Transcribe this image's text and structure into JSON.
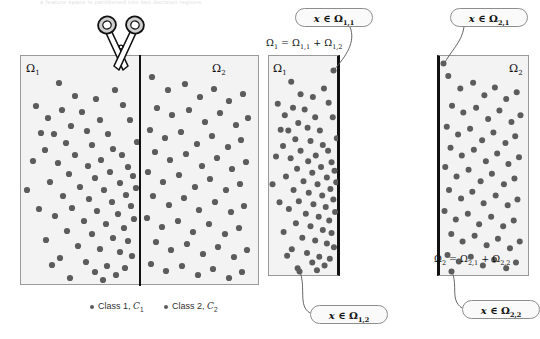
{
  "figure": {
    "top_caption": "a feature space is partitioned into two decision regions",
    "background_color": "#ffffff",
    "panel_fill": "#f3f3f3",
    "panel_border_color": "#9a9a9a",
    "cut_line_color": "#111111",
    "dot_color": "#5c5c5c"
  },
  "panels": {
    "left": {
      "name": "full-feature-space",
      "omega_left_label": "Ω",
      "omega_left_sub": "1",
      "omega_right_label": "Ω",
      "omega_right_sub": "2"
    },
    "middle": {
      "name": "omega-1-region",
      "omega_label": "Ω",
      "omega_sub": "1",
      "equation_main": "Ω",
      "equation_sub1": "1",
      "equation_rest": " = Ω",
      "equation_sub2": "1,1",
      "equation_plus": " + Ω",
      "equation_sub3": "1,2"
    },
    "right": {
      "name": "omega-2-region",
      "omega_label": "Ω",
      "omega_sub": "2",
      "equation_main": "Ω",
      "equation_sub1": "2",
      "equation_rest": " = Ω",
      "equation_sub2": "2,1",
      "equation_plus": " + Ω",
      "equation_sub3": "2,2"
    }
  },
  "callouts": {
    "omega_1_1": {
      "x": "x",
      "member": " ∈ Ω",
      "sub": "1,1"
    },
    "omega_1_2": {
      "x": "x",
      "member": " ∈ Ω",
      "sub": "1,2"
    },
    "omega_2_1": {
      "x": "x",
      "member": " ∈ Ω",
      "sub": "2,1"
    },
    "omega_2_2": {
      "x": "x",
      "member": " ∈ Ω",
      "sub": "2,2"
    }
  },
  "legend": {
    "items": [
      {
        "label": "Class 1, ",
        "symbol": "C",
        "sub": "1"
      },
      {
        "label": "Class 2, ",
        "symbol": "C",
        "sub": "2"
      }
    ]
  },
  "icons": {
    "scissors": "scissors-icon"
  },
  "chart_data": {
    "type": "scatter",
    "title": "",
    "xlabel": "",
    "ylabel": "",
    "grid": false,
    "legend_position": "bottom",
    "series": [
      {
        "name": "Class 1, C1",
        "color": "#5c5c5c"
      },
      {
        "name": "Class 2, C2",
        "color": "#5c5c5c"
      }
    ],
    "note": "Two overlapping Gaussian-like clouds of gray points; a vertical cut at x=139px separates region Omega-1 (left) from Omega-2 (right).",
    "points_left_region": [
      [
        59,
        83
      ],
      [
        75,
        96
      ],
      [
        36,
        106
      ],
      [
        62,
        110
      ],
      [
        48,
        118
      ],
      [
        82,
        112
      ],
      [
        96,
        99
      ],
      [
        71,
        126
      ],
      [
        87,
        131
      ],
      [
        54,
        134
      ],
      [
        100,
        120
      ],
      [
        66,
        143
      ],
      [
        92,
        145
      ],
      [
        108,
        134
      ],
      [
        45,
        150
      ],
      [
        75,
        155
      ],
      [
        113,
        149
      ],
      [
        58,
        163
      ],
      [
        88,
        166
      ],
      [
        101,
        160
      ],
      [
        122,
        155
      ],
      [
        69,
        174
      ],
      [
        95,
        178
      ],
      [
        110,
        172
      ],
      [
        128,
        167
      ],
      [
        50,
        182
      ],
      [
        80,
        187
      ],
      [
        104,
        190
      ],
      [
        120,
        183
      ],
      [
        133,
        176
      ],
      [
        63,
        196
      ],
      [
        89,
        199
      ],
      [
        112,
        202
      ],
      [
        126,
        195
      ],
      [
        136,
        188
      ],
      [
        72,
        208
      ],
      [
        97,
        211
      ],
      [
        118,
        214
      ],
      [
        131,
        206
      ],
      [
        55,
        216
      ],
      [
        84,
        221
      ],
      [
        106,
        224
      ],
      [
        124,
        228
      ],
      [
        134,
        219
      ],
      [
        67,
        231
      ],
      [
        92,
        234
      ],
      [
        113,
        238
      ],
      [
        128,
        241
      ],
      [
        78,
        246
      ],
      [
        100,
        249
      ],
      [
        120,
        252
      ],
      [
        132,
        256
      ],
      [
        60,
        258
      ],
      [
        86,
        262
      ],
      [
        107,
        266
      ],
      [
        125,
        268
      ],
      [
        95,
        272
      ],
      [
        116,
        275
      ],
      [
        70,
        278
      ],
      [
        103,
        280
      ],
      [
        41,
        133
      ],
      [
        33,
        161
      ],
      [
        27,
        190
      ],
      [
        39,
        209
      ],
      [
        46,
        240
      ],
      [
        52,
        265
      ],
      [
        137,
        142
      ],
      [
        130,
        120
      ],
      [
        123,
        105
      ],
      [
        115,
        90
      ]
    ],
    "points_right_region": [
      [
        152,
        77
      ],
      [
        168,
        90
      ],
      [
        185,
        84
      ],
      [
        200,
        97
      ],
      [
        214,
        89
      ],
      [
        229,
        101
      ],
      [
        243,
        94
      ],
      [
        157,
        108
      ],
      [
        172,
        115
      ],
      [
        189,
        110
      ],
      [
        205,
        122
      ],
      [
        220,
        113
      ],
      [
        236,
        125
      ],
      [
        248,
        118
      ],
      [
        150,
        130
      ],
      [
        165,
        138
      ],
      [
        181,
        132
      ],
      [
        197,
        144
      ],
      [
        212,
        136
      ],
      [
        228,
        147
      ],
      [
        241,
        140
      ],
      [
        155,
        152
      ],
      [
        170,
        160
      ],
      [
        186,
        154
      ],
      [
        202,
        166
      ],
      [
        217,
        158
      ],
      [
        232,
        169
      ],
      [
        246,
        162
      ],
      [
        148,
        172
      ],
      [
        163,
        182
      ],
      [
        179,
        175
      ],
      [
        195,
        187
      ],
      [
        210,
        179
      ],
      [
        226,
        190
      ],
      [
        240,
        184
      ],
      [
        153,
        196
      ],
      [
        169,
        205
      ],
      [
        184,
        198
      ],
      [
        199,
        210
      ],
      [
        215,
        202
      ],
      [
        231,
        212
      ],
      [
        244,
        206
      ],
      [
        147,
        218
      ],
      [
        162,
        227
      ],
      [
        178,
        221
      ],
      [
        193,
        232
      ],
      [
        209,
        224
      ],
      [
        225,
        234
      ],
      [
        239,
        228
      ],
      [
        156,
        242
      ],
      [
        171,
        250
      ],
      [
        187,
        244
      ],
      [
        203,
        254
      ],
      [
        218,
        247
      ],
      [
        234,
        257
      ],
      [
        247,
        250
      ],
      [
        151,
        264
      ],
      [
        166,
        271
      ],
      [
        182,
        266
      ],
      [
        198,
        275
      ],
      [
        213,
        269
      ],
      [
        229,
        278
      ],
      [
        242,
        272
      ]
    ]
  }
}
